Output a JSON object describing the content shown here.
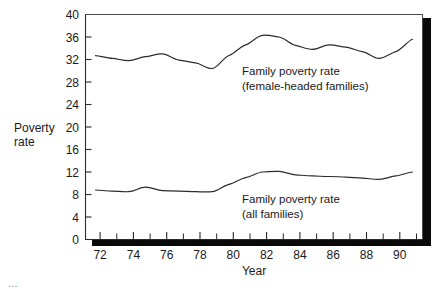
{
  "chart_data": {
    "type": "line",
    "title": "",
    "xlabel": "Year",
    "ylabel": "Poverty rate",
    "ylabel_line1": "Poverty",
    "ylabel_line2": "rate",
    "xlim": [
      71.4,
      91.6
    ],
    "ylim": [
      0,
      40
    ],
    "grid": false,
    "legend_position": "inline-annotation",
    "y_ticks": [
      0,
      4,
      8,
      12,
      16,
      20,
      24,
      28,
      32,
      36,
      40
    ],
    "y_tick_labels": [
      "0",
      "4",
      "8",
      "12",
      "16",
      "20",
      "24",
      "28",
      "32",
      "36",
      "40"
    ],
    "x_ticks_major": [
      72,
      74,
      76,
      78,
      80,
      82,
      84,
      86,
      88,
      90
    ],
    "x_tick_labels": [
      "72",
      "74",
      "76",
      "78",
      "80",
      "82",
      "84",
      "86",
      "88",
      "90"
    ],
    "x_ticks_minor": [
      73,
      75,
      77,
      79,
      81,
      83,
      85,
      87,
      89,
      91
    ],
    "x": [
      72,
      73,
      74,
      75,
      76,
      77,
      78,
      79,
      80,
      81,
      82,
      83,
      84,
      85,
      86,
      87,
      88,
      89,
      90,
      91
    ],
    "series": [
      {
        "name": "Family poverty rate (female-headed families)",
        "label_line1": "Family poverty rate",
        "label_line2": "(female-headed families)",
        "color": "#2b2b2b",
        "values": [
          32.7,
          32.2,
          31.8,
          32.5,
          33.0,
          31.9,
          31.4,
          30.4,
          32.7,
          34.6,
          36.3,
          36.0,
          34.5,
          33.8,
          34.6,
          34.2,
          33.4,
          32.2,
          33.4,
          35.6
        ]
      },
      {
        "name": "Family poverty rate (all families)",
        "label_line1": "Family poverty rate",
        "label_line2": "(all families)",
        "color": "#2b2b2b",
        "values": [
          8.8,
          8.6,
          8.5,
          9.3,
          8.7,
          8.6,
          8.5,
          8.5,
          9.8,
          11.0,
          12.0,
          12.1,
          11.5,
          11.3,
          11.2,
          11.1,
          10.9,
          10.7,
          11.3,
          12.0
        ]
      }
    ],
    "annotations": [
      {
        "id": "upper-series-annotation",
        "line1": "Family poverty rate",
        "line2": "(female-headed families)"
      },
      {
        "id": "lower-series-annotation",
        "line1": "Family poverty rate",
        "line2": "(all families)"
      }
    ]
  },
  "figure": {
    "bottom_clipped_text": "..."
  }
}
